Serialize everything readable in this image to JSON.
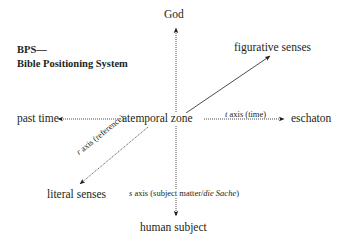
{
  "title": {
    "line1": "BPS—",
    "line2": "Bible Positioning System"
  },
  "poles": {
    "top": "God",
    "bottom": "human subject",
    "left": "past time",
    "right": "eschaton",
    "upper_right": "figurative senses",
    "lower_left": "literal senses",
    "center": "atemporal zone"
  },
  "axes": {
    "t": {
      "letter": "t",
      "label": " axis (time)"
    },
    "r": {
      "letter": "r",
      "label": " axis (reference)"
    },
    "s": {
      "letter": "s",
      "label_a": " axis (subject matter/",
      "label_b": "die Sache",
      "label_c": ")"
    }
  },
  "colors": {
    "ink": "#231f20",
    "background": "#ffffff"
  }
}
